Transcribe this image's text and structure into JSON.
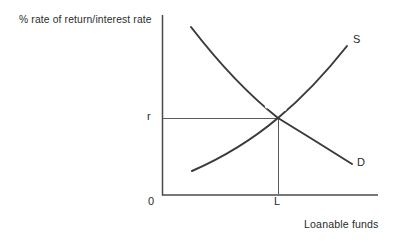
{
  "figure": {
    "y_axis_title": "% rate of return/interest rate",
    "x_axis_title": "Loanable funds",
    "origin_label": "0",
    "curves": {
      "supply_label": "S",
      "demand_label": "D"
    },
    "equilibrium": {
      "rate_label": "r",
      "quantity_label": "L"
    },
    "colors": {
      "curve": "#3a3a3a",
      "axis": "#4a4a4a",
      "guide": "#5a5a5a",
      "text": "#2b2b2b",
      "background": "#ffffff"
    }
  }
}
